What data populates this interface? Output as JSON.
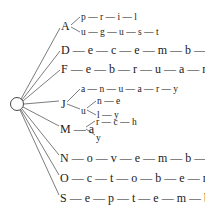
{
  "diagram": {
    "type": "trie",
    "root": {
      "shape": "circle",
      "label": ""
    },
    "branches": [
      {
        "initial": "A",
        "children": [
          {
            "letters": [
              "p",
              "r",
              "i",
              "l"
            ],
            "word": "April"
          },
          {
            "letters": [
              "u",
              "g",
              "u",
              "s",
              "t"
            ],
            "word": "August"
          }
        ]
      },
      {
        "initial": "D",
        "letters": [
          "e",
          "c",
          "e",
          "m",
          "b",
          "e",
          "r"
        ],
        "word": "December"
      },
      {
        "initial": "F",
        "letters": [
          "e",
          "b",
          "r",
          "u",
          "a",
          "r",
          "y"
        ],
        "word": "February"
      },
      {
        "initial": "J",
        "children": [
          {
            "letters": [
              "a",
              "n",
              "u",
              "a",
              "r",
              "y"
            ],
            "word": "January"
          },
          {
            "shared": "u",
            "children": [
              {
                "letters": [
                  "n",
                  "e"
                ],
                "word": "June"
              },
              {
                "letters": [
                  "l",
                  "y"
                ],
                "word": "July"
              }
            ]
          }
        ]
      },
      {
        "initial": "M",
        "shared": "a",
        "children": [
          {
            "letters": [
              "r",
              "c",
              "h"
            ],
            "word": "March"
          },
          {
            "letters": [
              "y"
            ],
            "word": "May"
          }
        ]
      },
      {
        "initial": "N",
        "letters": [
          "o",
          "v",
          "e",
          "m",
          "b",
          "e",
          "r"
        ],
        "word": "November"
      },
      {
        "initial": "O",
        "letters": [
          "c",
          "t",
          "o",
          "b",
          "e",
          "r"
        ],
        "word": "October"
      },
      {
        "initial": "S",
        "letters": [
          "e",
          "p",
          "t",
          "e",
          "m",
          "b",
          "e",
          "r"
        ],
        "word": "September"
      }
    ]
  },
  "labels": {
    "A": "A",
    "A_april": "p — r — i — l",
    "A_august": "u — g — u — s — t",
    "D": "D — e — c — e — m — b — e — r",
    "F": "F — e — b — r — u — a — r — y",
    "J": "J",
    "J_january": "a — n — u — a — r — y",
    "J_u": "u",
    "J_june": "n — e",
    "J_july": "l — y",
    "M": "M — a",
    "M_march": "r — c — h",
    "M_may": "y",
    "N": "N — o — v — e — m — b — e — r",
    "O": "O — c — t — o — b — e — r",
    "S": "S — e — p — t — e — m — b — e — r"
  },
  "colors": {
    "ink": "#222222",
    "background": "#ffffff"
  }
}
